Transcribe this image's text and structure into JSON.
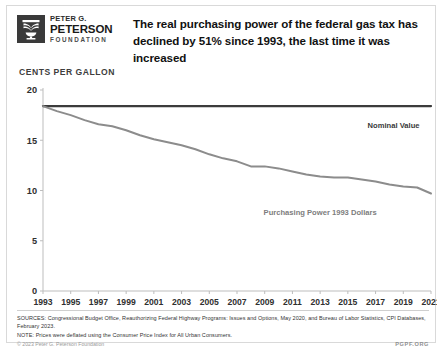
{
  "brand": {
    "logo_icon": "peterson-foundation-logo-icon",
    "line1": "PETER G.",
    "line2": "PETERSON",
    "line3": "FOUNDATION"
  },
  "header": {
    "title": "The real purchasing power of the federal gas tax has declined by 51% since 1993, the last time it was increased"
  },
  "footer": {
    "sources": "SOURCES: Congressional Budget Office, Reauthorizing Federal Highway Programs: Issues and Options, May 2020, and Bureau of Labor Statistics, CPI Databases, February 2023.",
    "note": "NOTE: Prices were deflated using the Consumer Price Index for All Urban Consumers.",
    "copyright": "© 2023 Peter G. Peterson Foundation",
    "site": "PGPF.ORG"
  },
  "colors": {
    "nominal_line": "#3b3b3b",
    "purchasing_line": "#8c8c8c",
    "axis": "#bdbdbd",
    "tick_text": "#2f2f2f",
    "label_text": "#6e6e6e"
  },
  "chart_data": {
    "type": "line",
    "title": "The real purchasing power of the federal gas tax has declined by 51% since 1993, the last time it was increased",
    "ylabel": "Cents Per Gallon",
    "xlabel": "",
    "ylim": [
      0,
      20
    ],
    "yticks": [
      0,
      5,
      10,
      15,
      20
    ],
    "xlim": [
      1993,
      2021
    ],
    "xticks": [
      1993,
      1995,
      1997,
      1999,
      2001,
      2003,
      2005,
      2007,
      2009,
      2011,
      2013,
      2015,
      2017,
      2019,
      2021
    ],
    "grid": false,
    "legend_position": "inline-annotation",
    "x": [
      1993,
      1994,
      1995,
      1996,
      1997,
      1998,
      1999,
      2000,
      2001,
      2002,
      2003,
      2004,
      2005,
      2006,
      2007,
      2008,
      2009,
      2010,
      2011,
      2012,
      2013,
      2014,
      2015,
      2016,
      2017,
      2018,
      2019,
      2020,
      2021
    ],
    "series": [
      {
        "name": "Nominal Value",
        "color": "#3b3b3b",
        "annotation": "Nominal Value",
        "values": [
          18.4,
          18.4,
          18.4,
          18.4,
          18.4,
          18.4,
          18.4,
          18.4,
          18.4,
          18.4,
          18.4,
          18.4,
          18.4,
          18.4,
          18.4,
          18.4,
          18.4,
          18.4,
          18.4,
          18.4,
          18.4,
          18.4,
          18.4,
          18.4,
          18.4,
          18.4,
          18.4,
          18.4,
          18.4
        ]
      },
      {
        "name": "Purchasing Power 1993 Dollars",
        "color": "#8c8c8c",
        "annotation": "Purchasing Power 1993 Dollars",
        "values": [
          18.4,
          17.9,
          17.5,
          17.0,
          16.6,
          16.4,
          16.0,
          15.5,
          15.1,
          14.8,
          14.5,
          14.1,
          13.6,
          13.2,
          12.9,
          12.4,
          12.4,
          12.2,
          11.9,
          11.6,
          11.4,
          11.3,
          11.3,
          11.1,
          10.9,
          10.6,
          10.4,
          10.3,
          9.7
        ]
      }
    ],
    "annotations": [
      {
        "text": "Nominal Value",
        "x": 2018.3,
        "y": 16.2,
        "align": "center",
        "color": "#3a3a3a"
      },
      {
        "text": "Purchasing Power 1993 Dollars",
        "x": 2013.0,
        "y": 7.6,
        "align": "center",
        "color": "#7d7d7d"
      }
    ]
  }
}
